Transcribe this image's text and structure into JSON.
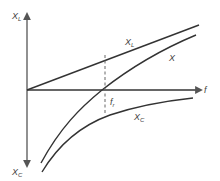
{
  "diagram": {
    "colors": {
      "axis": "#555555",
      "curve": "#333333",
      "dashed": "#666666",
      "label": "#444444"
    },
    "axes": {
      "vertical_top_label": "X",
      "vertical_top_sub": "L",
      "vertical_bottom_label": "X",
      "vertical_bottom_sub": "C",
      "horizontal_label": "f"
    },
    "curves": [
      {
        "id": "inductive",
        "label": "X",
        "sub": "L",
        "shape": "straight line rising from origin"
      },
      {
        "id": "net",
        "label": "X",
        "sub": "",
        "shape": "crosses f-axis at resonance"
      },
      {
        "id": "capacitive",
        "label": "X",
        "sub": "C",
        "shape": "negative hyperbola approaching axis"
      }
    ],
    "resonance": {
      "label": "f",
      "sub": "r"
    }
  }
}
